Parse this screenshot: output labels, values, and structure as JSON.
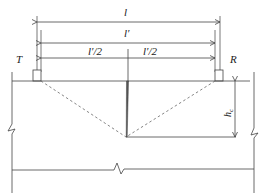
{
  "diagram": {
    "type": "engineering-schematic",
    "labels": {
      "overall_span": "l",
      "inner_span": "l′",
      "half_span_left": "l′/2",
      "half_span_right": "l′/2",
      "transmitter": "T",
      "receiver": "R",
      "crack_depth": "h",
      "crack_depth_subscript": "c"
    },
    "colors": {
      "line": "#444444",
      "dashed": "#666666",
      "background": "#ffffff"
    }
  }
}
